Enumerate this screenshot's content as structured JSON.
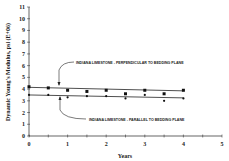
{
  "chart_data": {
    "type": "line",
    "title": "",
    "xlabel": "Years",
    "ylabel": "Dynamic Young's Modulus, psi (E+06)",
    "xlim": [
      0,
      5
    ],
    "ylim": [
      0,
      11
    ],
    "xticks": [
      0,
      1,
      2,
      3,
      4,
      5
    ],
    "yticks": [
      0,
      1,
      2,
      3,
      4,
      5,
      6,
      7,
      8,
      9,
      10,
      11
    ],
    "grid": false,
    "legend": "none (inline annotations with arrows)",
    "series": [
      {
        "name": "INDIANA LIMESTONE - PERPENDICULAR TO BEDDING PLANE",
        "marker": "square",
        "x": [
          0,
          0.5,
          1,
          1.5,
          2,
          2.5,
          3,
          3.5,
          4
        ],
        "values": [
          4.2,
          4.1,
          3.9,
          3.8,
          3.9,
          3.6,
          3.9,
          3.6,
          3.9
        ],
        "trendline": {
          "x": [
            0,
            4
          ],
          "y": [
            4.15,
            3.85
          ]
        }
      },
      {
        "name": "INDIANA LIMESTONE - PARALLEL TO BEDDING PLANE",
        "marker": "dot",
        "x": [
          0,
          0.5,
          1,
          1.5,
          2,
          2.5,
          3,
          3.5,
          4
        ],
        "values": [
          3.5,
          3.5,
          3.3,
          3.4,
          3.4,
          3.2,
          3.5,
          3.0,
          3.2
        ],
        "trendline": {
          "x": [
            0,
            4
          ],
          "y": [
            3.5,
            3.25
          ]
        }
      }
    ],
    "annotations": [
      {
        "text": "INDIANA LIMESTONE - PERPENDICULAR TO BEDDING PLANE",
        "points_to": "upper series near x=0.65"
      },
      {
        "text": "INDIANA LIMESTONE - PARALLEL TO BEDDING PLANE",
        "points_to": "lower series near x=0.8"
      }
    ]
  },
  "labels": {
    "xlabel": "Years",
    "ylabel": "Dynamic Young's Modulus, psi (E+06)",
    "annot_perp": "INDIANA LIMESTONE - PERPENDICULAR TO BEDDING PLANE",
    "annot_par": "INDIANA LIMESTONE - PARALLEL TO BEDDING PLANE"
  }
}
